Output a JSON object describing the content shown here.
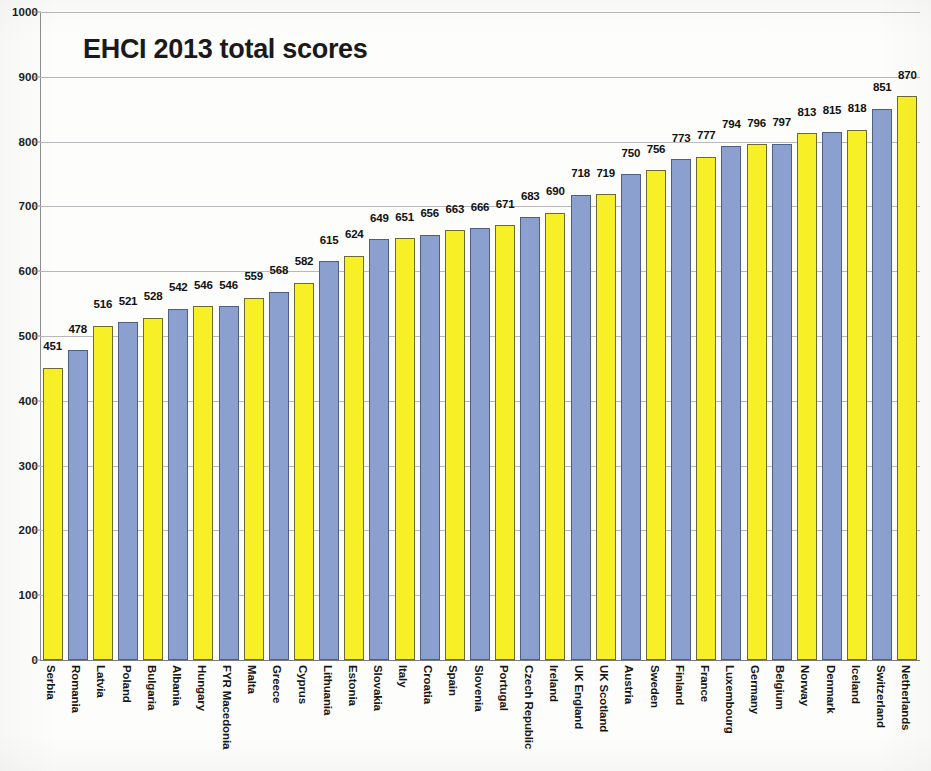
{
  "chart_data": {
    "type": "bar",
    "title": "EHCI 2013 total scores",
    "xlabel": "",
    "ylabel": "",
    "ylim": [
      0,
      1000
    ],
    "y_ticks": [
      0,
      100,
      200,
      300,
      400,
      500,
      600,
      700,
      800,
      900,
      1000
    ],
    "grid": true,
    "legend": null,
    "bar_colors": [
      "#f7f026",
      "#8ba0ce"
    ],
    "bar_color_pattern": "alternating yellow and blue-grey by category order",
    "categories": [
      "Serbia",
      "Romania",
      "Latvia",
      "Poland",
      "Bulgaria",
      "Albania",
      "Hungary",
      "FYR Macedonia",
      "Malta",
      "Greece",
      "Cyprus",
      "Lithuania",
      "Estonia",
      "Slovakia",
      "Italy",
      "Croatia",
      "Spain",
      "Slovenia",
      "Portugal",
      "Czech Republic",
      "Ireland",
      "UK England",
      "UK Scotland",
      "Austria",
      "Sweden",
      "Finland",
      "France",
      "Luxembourg",
      "Germany",
      "Belgium",
      "Norway",
      "Denmark",
      "Iceland",
      "Switzerland",
      "Netherlands"
    ],
    "values": [
      451,
      478,
      516,
      521,
      528,
      542,
      546,
      546,
      559,
      568,
      582,
      615,
      624,
      649,
      651,
      656,
      663,
      666,
      671,
      683,
      690,
      718,
      719,
      750,
      756,
      773,
      777,
      794,
      796,
      797,
      813,
      815,
      818,
      851,
      870
    ]
  },
  "axis": {
    "y_tick_labels": [
      "1000",
      "900",
      "800",
      "700",
      "600",
      "500",
      "400",
      "300",
      "200",
      "100",
      "0"
    ]
  }
}
